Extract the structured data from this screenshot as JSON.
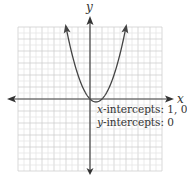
{
  "chart_data": {
    "type": "line",
    "title": "",
    "function": "y = x^2 - x",
    "xlabel": "x",
    "ylabel": "y",
    "xlim": [
      -6,
      6
    ],
    "ylim": [
      -6,
      6
    ],
    "grid": true,
    "grid_major_step": 1,
    "grid_minor_step": 0.5,
    "series": [
      {
        "name": "parabola",
        "x": [
          -2,
          -1.5,
          -1,
          -0.5,
          0,
          0.5,
          1,
          1.5,
          2,
          2.5,
          3
        ],
        "y": [
          6,
          3.75,
          2,
          0.75,
          0,
          -0.25,
          0,
          0.75,
          2,
          3.75,
          6
        ]
      }
    ],
    "annotations": [
      {
        "var": "x",
        "text": "-intercepts: 1, 0"
      },
      {
        "var": "y",
        "text": "-intercepts: 0"
      }
    ]
  },
  "colors": {
    "curve": "#444444",
    "axis": "#444444",
    "grid_major": "#cfcfcf",
    "grid_minor": "#e6e6e6"
  }
}
